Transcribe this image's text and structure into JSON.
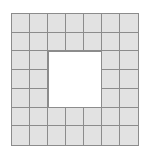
{
  "figure": {
    "background_color": "#ffffff",
    "tile_fill_color": "#e2e2e2",
    "grid_line_color": "#8c8c8c",
    "hole_fill_color": "#ffffff",
    "grid": {
      "columns": 7,
      "rows": 7,
      "total_cells": 49,
      "hole_columns": 3,
      "hole_rows": 3,
      "hole_cells": 9,
      "shaded_cells": 40,
      "hole_start_row": 3,
      "hole_end_row": 5,
      "hole_start_column": 3,
      "hole_end_column": 5
    },
    "cells": [
      [
        "filled",
        "filled",
        "filled",
        "filled",
        "filled",
        "filled",
        "filled"
      ],
      [
        "filled",
        "filled",
        "filled",
        "filled",
        "filled",
        "filled",
        "filled"
      ],
      [
        "filled",
        "filled",
        "hole",
        "hole",
        "hole",
        "filled",
        "filled"
      ],
      [
        "filled",
        "filled",
        "hole",
        "hole",
        "hole",
        "filled",
        "filled"
      ],
      [
        "filled",
        "filled",
        "hole",
        "hole",
        "hole",
        "filled",
        "filled"
      ],
      [
        "filled",
        "filled",
        "filled",
        "filled",
        "filled",
        "filled",
        "filled"
      ],
      [
        "filled",
        "filled",
        "filled",
        "filled",
        "filled",
        "filled",
        "filled"
      ]
    ]
  }
}
